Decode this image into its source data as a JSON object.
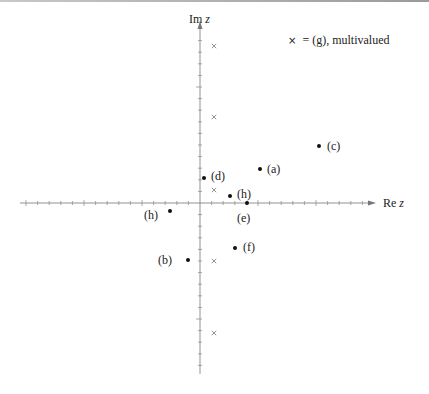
{
  "diagram": {
    "axes": {
      "x_label": "Re",
      "x_var": "z",
      "y_label": "Im",
      "y_var": "z"
    },
    "legend": {
      "symbol": "×",
      "text": "= (g), multivalued"
    },
    "points": [
      {
        "id": "a",
        "label": "(a)",
        "px": 260,
        "py": 169,
        "lx": 267,
        "ly": 173
      },
      {
        "id": "b",
        "label": "(b)",
        "px": 188,
        "py": 260,
        "lx": 158,
        "ly": 264
      },
      {
        "id": "c",
        "label": "(c)",
        "px": 319,
        "py": 146,
        "lx": 327,
        "ly": 150
      },
      {
        "id": "d",
        "label": "(d)",
        "px": 204,
        "py": 178,
        "lx": 211,
        "ly": 180
      },
      {
        "id": "e",
        "label": "(e)",
        "px": 247,
        "py": 203,
        "lx": 237,
        "ly": 222
      },
      {
        "id": "f",
        "label": "(f)",
        "px": 235,
        "py": 248,
        "lx": 243,
        "ly": 251
      },
      {
        "id": "h1",
        "label": "(h)",
        "px": 230,
        "py": 196,
        "lx": 237,
        "ly": 198
      },
      {
        "id": "h2",
        "label": "(h)",
        "px": 170,
        "py": 211,
        "lx": 144,
        "ly": 219
      }
    ],
    "crosses": [
      {
        "x": 214,
        "y": 46
      },
      {
        "x": 214,
        "y": 117
      },
      {
        "x": 214,
        "y": 190
      },
      {
        "x": 214,
        "y": 261
      },
      {
        "x": 214,
        "y": 333
      }
    ]
  }
}
